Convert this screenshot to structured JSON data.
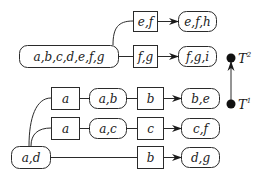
{
  "diagram": {
    "nodes": [
      {
        "id": "n_abcdefg",
        "label": "a,b,c,d,e,f,g",
        "shape": "rounded"
      },
      {
        "id": "e_ef",
        "label": "e,f",
        "shape": "box"
      },
      {
        "id": "n_efh",
        "label": "e,f,h",
        "shape": "rounded"
      },
      {
        "id": "e_fg",
        "label": "f,g",
        "shape": "box"
      },
      {
        "id": "n_fgi",
        "label": "f,g,i",
        "shape": "rounded"
      },
      {
        "id": "e_a1",
        "label": "a",
        "shape": "box"
      },
      {
        "id": "n_ab",
        "label": "a,b",
        "shape": "rounded"
      },
      {
        "id": "e_b1",
        "label": "b",
        "shape": "box"
      },
      {
        "id": "n_be",
        "label": "b,e",
        "shape": "rounded"
      },
      {
        "id": "e_a2",
        "label": "a",
        "shape": "box"
      },
      {
        "id": "n_ac",
        "label": "a,c",
        "shape": "rounded"
      },
      {
        "id": "e_c",
        "label": "c",
        "shape": "box"
      },
      {
        "id": "n_cf",
        "label": "c,f",
        "shape": "rounded"
      },
      {
        "id": "n_ad",
        "label": "a,d",
        "shape": "rounded"
      },
      {
        "id": "e_b2",
        "label": "b",
        "shape": "box"
      },
      {
        "id": "n_dg",
        "label": "d,g",
        "shape": "rounded"
      }
    ],
    "edges": [
      {
        "from": "n_abcdefg",
        "to": "e_ef"
      },
      {
        "from": "e_ef",
        "to": "n_efh",
        "arrow": true
      },
      {
        "from": "n_abcdefg",
        "to": "e_fg"
      },
      {
        "from": "e_fg",
        "to": "n_fgi",
        "arrow": true
      },
      {
        "from": "n_ad",
        "to": "e_a1"
      },
      {
        "from": "e_a1",
        "to": "n_ab"
      },
      {
        "from": "n_ab",
        "to": "e_b1"
      },
      {
        "from": "e_b1",
        "to": "n_be",
        "arrow": true
      },
      {
        "from": "n_ad",
        "to": "e_a2"
      },
      {
        "from": "e_a2",
        "to": "n_ac"
      },
      {
        "from": "n_ac",
        "to": "e_c"
      },
      {
        "from": "e_c",
        "to": "n_cf",
        "arrow": true
      },
      {
        "from": "n_ad",
        "to": "e_b2"
      },
      {
        "from": "e_b2",
        "to": "n_dg",
        "arrow": true
      }
    ],
    "timeline": {
      "t1": {
        "symbol": "T",
        "sup": "1"
      },
      "t2": {
        "symbol": "T",
        "sup": "2"
      },
      "direction": "T1 to T2 (upward arrow)"
    }
  }
}
